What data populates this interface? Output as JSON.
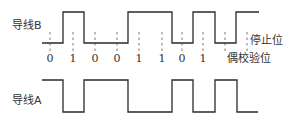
{
  "diagram": {
    "title": "",
    "line_b_label": "导线B",
    "line_a_label": "导线A",
    "bits": [
      "0",
      "1",
      "0",
      "0",
      "1",
      "1",
      "0",
      "1"
    ],
    "parity_label": "偶校验位",
    "stop_label": "停止位",
    "line_b_levels": [
      "low",
      "high",
      "low",
      "high",
      "low",
      "high",
      "low",
      "high"
    ],
    "line_a_levels": [
      "high",
      "low",
      "high",
      "low",
      "high",
      "low",
      "high",
      "low"
    ],
    "colors": {
      "stroke": "#2a2a2a",
      "text": "#333333"
    }
  }
}
